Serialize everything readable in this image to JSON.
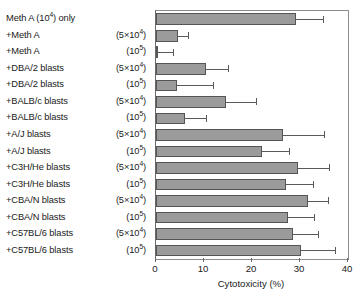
{
  "chart_data": {
    "type": "bar",
    "orientation": "horizontal",
    "title": "",
    "xlabel": "Cytotoxicity (%)",
    "ylabel": "",
    "xlim": [
      0,
      40
    ],
    "xticks": [
      0,
      10,
      20,
      30,
      40
    ],
    "grid": false,
    "legend": false,
    "bar_color": "#9b9b9b",
    "bar_edge_color": "#555555",
    "error_bars": true,
    "categories": [
      "Meth A (10⁴) only",
      "+Meth A",
      "+Meth A",
      "+DBA/2 blasts",
      "+DBA/2 blasts",
      "+BALB/c blasts",
      "+BALB/c blasts",
      "+A/J blasts",
      "+A/J blasts",
      "+C3H/He blasts",
      "+C3H/He blasts",
      "+CBA/N blasts",
      "+CBA/N blasts",
      "+C57BL/6 blasts",
      "+C57BL/6 blasts"
    ],
    "doses": [
      "",
      "(5×10⁴)",
      "(10⁵)",
      "(5×10⁴)",
      "(10⁵)",
      "(5×10⁴)",
      "(10⁵)",
      "(5×10⁴)",
      "(10⁵)",
      "(5×10⁴)",
      "(10⁵)",
      "(5×10⁴)",
      "(10⁵)",
      "(5×10⁴)",
      "(10⁵)"
    ],
    "values": [
      29.2,
      4.6,
      0.3,
      10.4,
      4.4,
      14.6,
      6.0,
      26.5,
      22.0,
      29.6,
      27.0,
      31.7,
      27.5,
      28.5,
      30.2
    ],
    "errors": [
      5.6,
      2.0,
      3.2,
      4.6,
      7.5,
      6.2,
      4.4,
      8.4,
      5.8,
      6.4,
      5.7,
      4.2,
      5.5,
      5.3,
      7.0
    ]
  },
  "labels": {
    "rows": [
      {
        "name": "Meth A (10⁴) only",
        "dose": ""
      },
      {
        "name": "+Meth A",
        "dose": "(5×10⁴)"
      },
      {
        "name": "+Meth A",
        "dose": "(10⁵)"
      },
      {
        "name": "+DBA/2 blasts",
        "dose": "(5×10⁴)"
      },
      {
        "name": "+DBA/2 blasts",
        "dose": "(10⁵)"
      },
      {
        "name": "+BALB/c blasts",
        "dose": "(5×10⁴)"
      },
      {
        "name": "+BALB/c blasts",
        "dose": "(10⁵)"
      },
      {
        "name": "+A/J blasts",
        "dose": "(5×10⁴)"
      },
      {
        "name": "+A/J blasts",
        "dose": "(10⁵)"
      },
      {
        "name": "+C3H/He blasts",
        "dose": "(5×10⁴)"
      },
      {
        "name": "+C3H/He blasts",
        "dose": "(10⁵)"
      },
      {
        "name": "+CBA/N blasts",
        "dose": "(5×10⁴)"
      },
      {
        "name": "+CBA/N blasts",
        "dose": "(10⁵)"
      },
      {
        "name": "+C57BL/6 blasts",
        "dose": "(5×10⁴)"
      },
      {
        "name": "+C57BL/6 blasts",
        "dose": "(10⁵)"
      }
    ]
  },
  "axis": {
    "tick_labels": [
      "0",
      "10",
      "20",
      "30",
      "40"
    ],
    "title": "Cytotoxicity (%)"
  }
}
